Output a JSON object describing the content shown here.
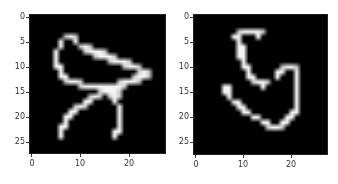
{
  "chart_data": [
    {
      "type": "heatmap",
      "title": "",
      "xlabel": "",
      "ylabel": "",
      "colormap": "gray",
      "shape": [
        28,
        28
      ],
      "xlim": [
        -0.5,
        27.5
      ],
      "ylim": [
        27.5,
        -0.5
      ],
      "xticks": [
        "0",
        "10",
        "20"
      ],
      "yticks": [
        "0",
        "5",
        "10",
        "15",
        "20",
        "25"
      ],
      "bright_pixels_by_row": {
        "4": [
          [
            7,
            9
          ]
        ],
        "5": [
          [
            6,
            6
          ],
          [
            9,
            9
          ]
        ],
        "6": [
          [
            6,
            6
          ],
          [
            10,
            12
          ]
        ],
        "7": [
          [
            5,
            5
          ],
          [
            11,
            15
          ]
        ],
        "8": [
          [
            5,
            5
          ],
          [
            13,
            17
          ]
        ],
        "9": [
          [
            5,
            5
          ],
          [
            16,
            20
          ]
        ],
        "10": [
          [
            5,
            6
          ],
          [
            19,
            22
          ]
        ],
        "11": [
          [
            6,
            6
          ],
          [
            22,
            24
          ]
        ],
        "12": [
          [
            6,
            7
          ],
          [
            21,
            24
          ]
        ],
        "13": [
          [
            7,
            10
          ],
          [
            18,
            22
          ]
        ],
        "14": [
          [
            10,
            19
          ]
        ],
        "15": [
          [
            14,
            18
          ]
        ],
        "16": [
          [
            12,
            14
          ],
          [
            16,
            18
          ]
        ],
        "17": [
          [
            11,
            12
          ],
          [
            17,
            17
          ]
        ],
        "18": [
          [
            9,
            11
          ],
          [
            18,
            18
          ]
        ],
        "19": [
          [
            8,
            9
          ],
          [
            18,
            18
          ]
        ],
        "20": [
          [
            7,
            8
          ],
          [
            18,
            18
          ]
        ],
        "21": [
          [
            7,
            7
          ],
          [
            18,
            18
          ]
        ],
        "22": [
          [
            6,
            7
          ],
          [
            18,
            18
          ]
        ],
        "23": [
          [
            6,
            6
          ],
          [
            17,
            18
          ]
        ],
        "24": [
          [
            6,
            6
          ],
          [
            17,
            17
          ]
        ]
      }
    },
    {
      "type": "heatmap",
      "title": "",
      "xlabel": "",
      "ylabel": "",
      "colormap": "gray",
      "shape": [
        28,
        28
      ],
      "xlim": [
        -0.5,
        27.5
      ],
      "ylim": [
        27.5,
        -0.5
      ],
      "xticks": [
        "0",
        "10",
        "20"
      ],
      "yticks": [
        "0",
        "5",
        "10",
        "15",
        "20",
        "25"
      ],
      "bright_pixels_by_row": {
        "3": [
          [
            9,
            14
          ]
        ],
        "4": [
          [
            8,
            9
          ],
          [
            13,
            13
          ]
        ],
        "5": [
          [
            9,
            9
          ]
        ],
        "6": [
          [
            9,
            10
          ]
        ],
        "7": [
          [
            9,
            10
          ]
        ],
        "8": [
          [
            9,
            10
          ]
        ],
        "9": [
          [
            10,
            10
          ]
        ],
        "10": [
          [
            10,
            11
          ],
          [
            18,
            21
          ]
        ],
        "11": [
          [
            11,
            11
          ],
          [
            17,
            18
          ],
          [
            21,
            21
          ]
        ],
        "12": [
          [
            11,
            12
          ],
          [
            17,
            17
          ],
          [
            21,
            21
          ]
        ],
        "13": [
          [
            12,
            15
          ],
          [
            21,
            21
          ]
        ],
        "14": [
          [
            6,
            7
          ],
          [
            14,
            14
          ],
          [
            21,
            21
          ]
        ],
        "15": [
          [
            6,
            7
          ],
          [
            21,
            21
          ]
        ],
        "16": [
          [
            7,
            7
          ],
          [
            21,
            21
          ]
        ],
        "17": [
          [
            8,
            9
          ],
          [
            21,
            21
          ]
        ],
        "18": [
          [
            9,
            10
          ],
          [
            21,
            21
          ]
        ],
        "19": [
          [
            10,
            11
          ],
          [
            20,
            21
          ]
        ],
        "20": [
          [
            12,
            13
          ],
          [
            19,
            20
          ]
        ],
        "21": [
          [
            14,
            15
          ],
          [
            18,
            19
          ]
        ],
        "22": [
          [
            15,
            18
          ]
        ]
      }
    }
  ],
  "panels": [
    {
      "xticks": [
        "0",
        "10",
        "20"
      ],
      "yticks": [
        "0",
        "5",
        "10",
        "15",
        "20",
        "25"
      ]
    },
    {
      "xticks": [
        "0",
        "10",
        "20"
      ],
      "yticks": [
        "0",
        "5",
        "10",
        "15",
        "20",
        "25"
      ]
    }
  ]
}
